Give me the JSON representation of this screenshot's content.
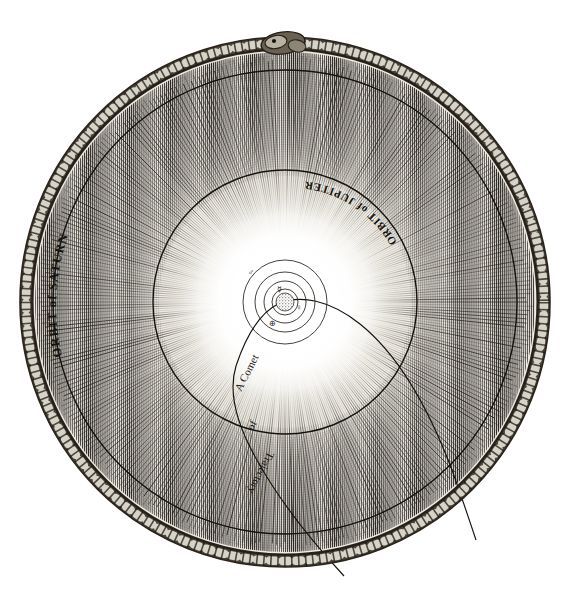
{
  "figure": {
    "kind": "antique-engraving",
    "background_color": "#ffffff",
    "ink_color": "#15120e",
    "paper_tone": "#f2efe8",
    "center": {
      "x": 285,
      "y": 302
    }
  },
  "labels": {
    "saturn_orbit": "ORBIT of SATURN",
    "jupiter_orbit": "ORBIT of JUPITER",
    "comet_line1": "Trajectory",
    "comet_line2": "of",
    "comet_line3": "A Comet"
  },
  "rings": [
    {
      "name": "outer-braided-border",
      "label": "",
      "radius": 263,
      "stroke_width": 13,
      "color": "#3a332a"
    },
    {
      "name": "orbit-of-saturn",
      "label": "ORBIT of SATURN",
      "radius": 232,
      "stroke_width": 1.3,
      "color": "#15120e"
    },
    {
      "name": "orbit-of-jupiter",
      "label": "ORBIT of JUPITER",
      "radius": 132,
      "stroke_width": 1.3,
      "color": "#15120e"
    },
    {
      "name": "orbit-of-mars",
      "label": "",
      "radius": 42,
      "stroke_width": 0.9,
      "color": "#2a251e"
    },
    {
      "name": "orbit-of-earth",
      "label": "",
      "radius": 30,
      "stroke_width": 0.9,
      "color": "#2a251e"
    },
    {
      "name": "orbit-of-venus",
      "label": "",
      "radius": 21,
      "stroke_width": 0.9,
      "color": "#2a251e"
    },
    {
      "name": "orbit-of-mercury",
      "label": "",
      "radius": 13,
      "stroke_width": 0.9,
      "color": "#2a251e"
    }
  ],
  "bodies": [
    {
      "name": "sun",
      "symbol": "☉",
      "radius_px": 9,
      "x": 285,
      "y": 302
    },
    {
      "name": "mercury",
      "symbol": "☿",
      "x": 279,
      "y": 290
    },
    {
      "name": "venus",
      "symbol": "♀",
      "x": 297,
      "y": 306
    },
    {
      "name": "earth",
      "symbol": "⊕",
      "x": 272,
      "y": 323
    },
    {
      "name": "mars",
      "symbol": "♂",
      "x": 251,
      "y": 272
    }
  ],
  "comet": {
    "name": "comet-trajectory",
    "label": "Trajectory of A Comet",
    "path_note": "parabolic arc sweeping from lower-left past the sun toward lower-right"
  },
  "texture": {
    "radial_rays_count": 360,
    "hatch_bands": 2,
    "glow_note": "bright white core fading to dense engraved hatching at rim"
  }
}
